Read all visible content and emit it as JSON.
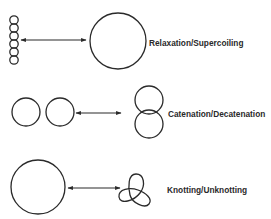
{
  "diagram": {
    "rows": [
      {
        "label": "Relaxation/Supercoiling",
        "left_figure": "supercoiled-dna",
        "right_figure": "relaxed-circle",
        "arrow": "bidirectional"
      },
      {
        "label": "Catenation/Decatenation",
        "left_figure": "two-separate-circles",
        "right_figure": "catenated-circles",
        "arrow": "bidirectional"
      },
      {
        "label": "Knotting/Unknotting",
        "left_figure": "unknotted-circle",
        "right_figure": "trefoil-knot",
        "arrow": "bidirectional"
      }
    ],
    "colors": {
      "line": "#2a2a2a",
      "background": "#ffffff"
    }
  }
}
